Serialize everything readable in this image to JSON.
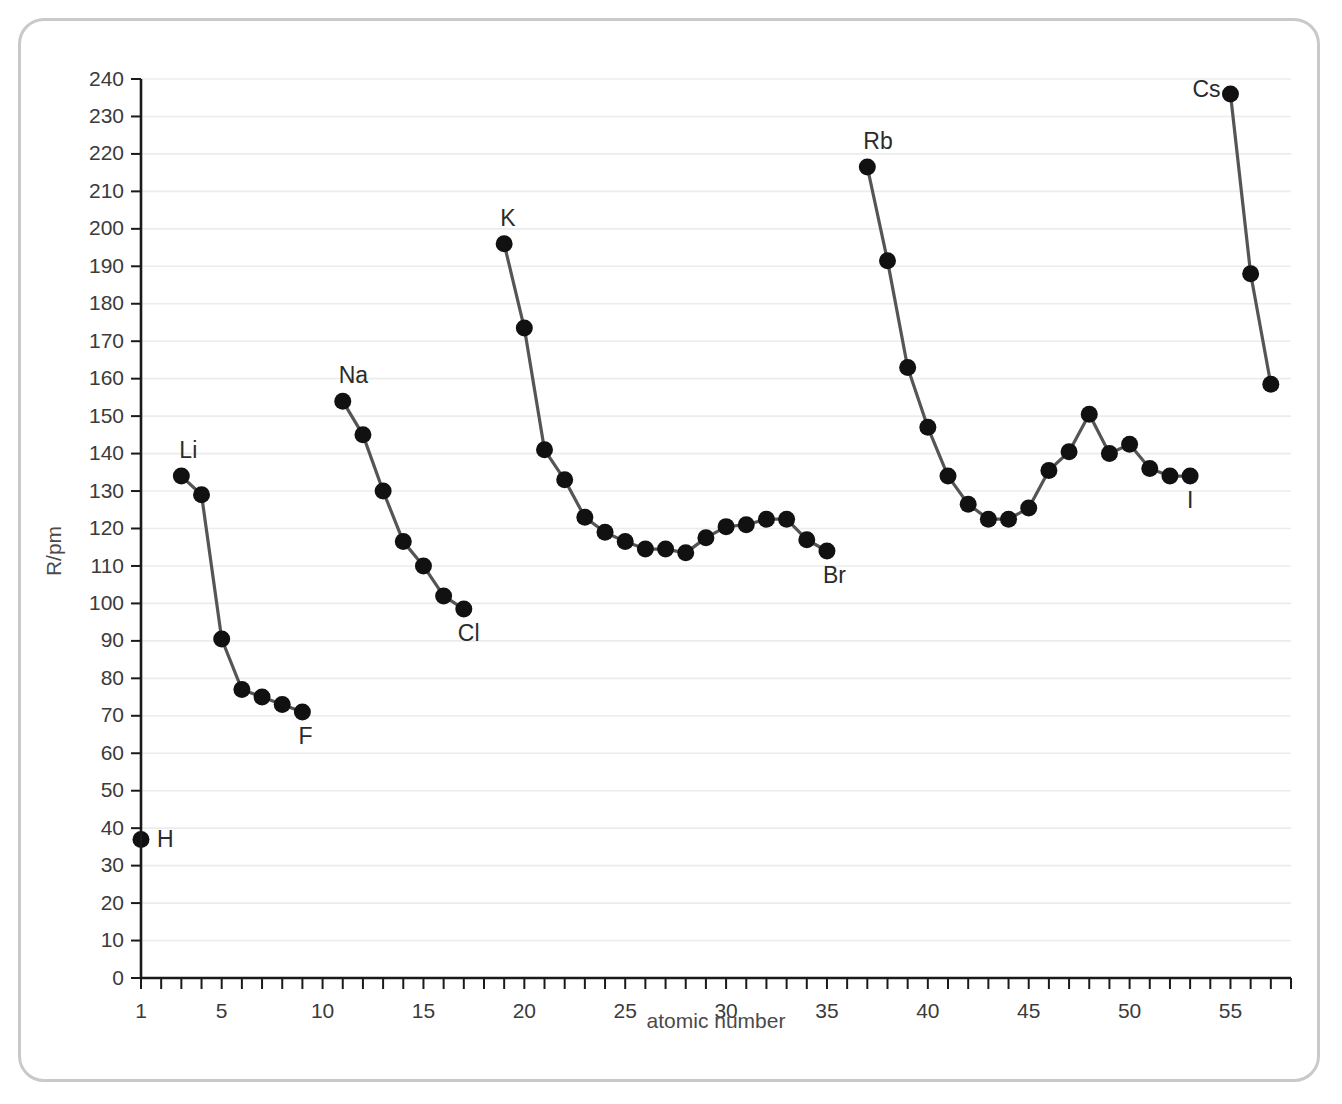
{
  "chart_data": {
    "type": "line",
    "title": "",
    "xlabel": "atomic number",
    "ylabel": "R/pm",
    "xlim": [
      1,
      58
    ],
    "ylim": [
      0,
      240
    ],
    "grid": true,
    "legend": "none",
    "y_ticks": [
      0,
      10,
      20,
      30,
      40,
      50,
      60,
      70,
      80,
      90,
      100,
      110,
      120,
      130,
      140,
      150,
      160,
      170,
      180,
      190,
      200,
      210,
      220,
      230,
      240
    ],
    "y_tick_labels": [
      "0",
      "10",
      "20",
      "30",
      "40",
      "50",
      "60",
      "70",
      "80",
      "90",
      "100",
      "110",
      "120",
      "130",
      "140",
      "150",
      "160",
      "170",
      "180",
      "190",
      "200",
      "210",
      "220",
      "230",
      "240"
    ],
    "x_ticks": [
      1,
      2,
      3,
      4,
      5,
      6,
      7,
      8,
      9,
      10,
      11,
      12,
      13,
      14,
      15,
      16,
      17,
      18,
      19,
      20,
      21,
      22,
      23,
      24,
      25,
      26,
      27,
      28,
      29,
      30,
      31,
      32,
      33,
      34,
      35,
      36,
      37,
      38,
      39,
      40,
      41,
      42,
      43,
      44,
      45,
      46,
      47,
      48,
      49,
      50,
      51,
      52,
      53,
      54,
      55,
      56,
      57,
      58
    ],
    "x_labeled_ticks": [
      1,
      5,
      10,
      15,
      20,
      25,
      30,
      35,
      40,
      45,
      50,
      55
    ],
    "x_tick_labels": [
      "1",
      "5",
      "10",
      "15",
      "20",
      "25",
      "30",
      "35",
      "40",
      "45",
      "50",
      "55"
    ],
    "series": [
      {
        "name": "period-1",
        "x": [
          1
        ],
        "y": [
          37
        ]
      },
      {
        "name": "period-2",
        "x": [
          3,
          4,
          5,
          6,
          7,
          8,
          9
        ],
        "y": [
          134,
          129,
          90.5,
          77,
          75,
          73,
          71
        ]
      },
      {
        "name": "period-3",
        "x": [
          11,
          12,
          13,
          14,
          15,
          16,
          17
        ],
        "y": [
          154,
          145,
          130,
          116.5,
          110,
          102,
          98.5
        ]
      },
      {
        "name": "period-4",
        "x": [
          19,
          20,
          21,
          22,
          23,
          24,
          25,
          26,
          27,
          28,
          29,
          30,
          31,
          32,
          33,
          34,
          35
        ],
        "y": [
          196,
          173.5,
          141,
          133,
          123,
          119,
          116.5,
          114.5,
          114.5,
          113.5,
          117.5,
          120.5,
          121,
          122.5,
          122.5,
          117,
          114
        ]
      },
      {
        "name": "period-5",
        "x": [
          37,
          38,
          39,
          40,
          41,
          42,
          43,
          44,
          45,
          46,
          47,
          48,
          49,
          50,
          51,
          52,
          53
        ],
        "y": [
          216.5,
          191.5,
          163,
          147,
          134,
          126.5,
          122.5,
          122.5,
          125.5,
          135.5,
          140.5,
          150.5,
          140,
          142.5,
          136,
          134,
          134
        ]
      },
      {
        "name": "period-6",
        "x": [
          55,
          56,
          57
        ],
        "y": [
          236,
          188,
          158.5
        ]
      }
    ],
    "point_labels": [
      {
        "text": "H",
        "x": 1,
        "y": 37,
        "dx": 16,
        "dy": 8
      },
      {
        "text": "Li",
        "x": 3,
        "y": 134,
        "dx": -2,
        "dy": -18
      },
      {
        "text": "F",
        "x": 9,
        "y": 71,
        "dx": -4,
        "dy": 32
      },
      {
        "text": "Na",
        "x": 11,
        "y": 154,
        "dx": -4,
        "dy": -18
      },
      {
        "text": "Cl",
        "x": 17,
        "y": 98.5,
        "dx": -6,
        "dy": 32
      },
      {
        "text": "K",
        "x": 19,
        "y": 196,
        "dx": -4,
        "dy": -18
      },
      {
        "text": "Br",
        "x": 35,
        "y": 114,
        "dx": -4,
        "dy": 32
      },
      {
        "text": "Rb",
        "x": 37,
        "y": 216.5,
        "dx": -4,
        "dy": -18
      },
      {
        "text": "I",
        "x": 53,
        "y": 134,
        "dx": -3,
        "dy": 32
      },
      {
        "text": "Cs",
        "x": 55,
        "y": 236,
        "dx": -38,
        "dy": 3
      }
    ]
  },
  "colors": {
    "frame": "#c9c9c9",
    "grid": "#ececec",
    "axis": "#1a1a1a",
    "line": "#555555",
    "marker": "#111111",
    "text": "#3b3b3b",
    "background": "#ffffff"
  }
}
